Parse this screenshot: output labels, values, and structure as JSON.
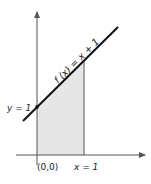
{
  "diagram": {
    "function_label": "f (x) = x + 1",
    "y_intercept_label": "y = 1",
    "origin_label": "(0,0)",
    "x_bound_label": "x = 1",
    "colors": {
      "line": "#111111",
      "axis": "#444444",
      "shade": "#e6e6e6",
      "background": "#ffffff"
    }
  }
}
